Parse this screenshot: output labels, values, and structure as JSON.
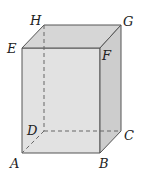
{
  "diagram": {
    "type": "rectangular-prism",
    "colors": {
      "front_face": "#e2e2e2",
      "top_face": "#d4d4d4",
      "right_face": "#cfcfcf",
      "edge": "#555555",
      "hidden_edge": "#666666"
    },
    "vertices": {
      "A": {
        "label": "A"
      },
      "B": {
        "label": "B"
      },
      "C": {
        "label": "C"
      },
      "D": {
        "label": "D"
      },
      "E": {
        "label": "E"
      },
      "F": {
        "label": "F"
      },
      "G": {
        "label": "G"
      },
      "H": {
        "label": "H"
      }
    }
  }
}
